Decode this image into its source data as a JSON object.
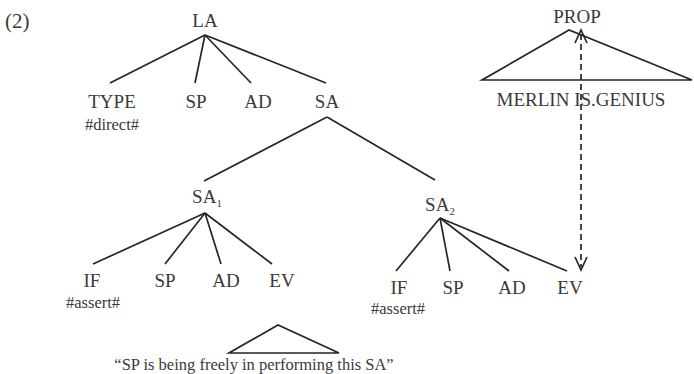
{
  "example_number": "(2)",
  "tree": {
    "root": {
      "label": "LA"
    },
    "la_children": [
      {
        "label": "TYPE",
        "annotation": "#direct#"
      },
      {
        "label": "SP"
      },
      {
        "label": "AD"
      },
      {
        "label": "SA"
      }
    ],
    "sa1": {
      "label": "SA",
      "subscript": "1",
      "children": [
        {
          "label": "IF",
          "annotation": "#assert#"
        },
        {
          "label": "SP"
        },
        {
          "label": "AD"
        },
        {
          "label": "EV"
        }
      ],
      "ev_gloss": "“SP is being freely in performing this SA”"
    },
    "sa2": {
      "label": "SA",
      "subscript": "2",
      "children": [
        {
          "label": "IF",
          "annotation": "#assert#"
        },
        {
          "label": "SP"
        },
        {
          "label": "AD"
        },
        {
          "label": "EV"
        }
      ]
    }
  },
  "prop": {
    "label": "PROP",
    "content": "MERLIN IS.GENIUS"
  },
  "link": {
    "type": "dashed-bidirectional-arrow",
    "from": "PROP",
    "to": "SA2.EV"
  }
}
